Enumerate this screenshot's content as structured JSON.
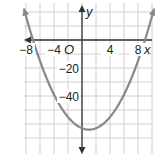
{
  "chart_data": {
    "type": "line",
    "title": "",
    "xlabel": "x",
    "ylabel": "y",
    "origin_label": "O",
    "xlim": [
      -11,
      10
    ],
    "ylim": [
      -72,
      20
    ],
    "x_grid_step": 2,
    "y_grid_step": 10,
    "grid": true,
    "x_ticks": [
      {
        "value": -8,
        "label": "−8"
      },
      {
        "value": -4,
        "label": "−4"
      },
      {
        "value": 4,
        "label": "4"
      },
      {
        "value": 8,
        "label": "8"
      }
    ],
    "y_ticks": [
      {
        "value": -20,
        "label": "−20"
      },
      {
        "value": -40,
        "label": "−40"
      }
    ],
    "series": [
      {
        "name": "parabola",
        "equation": "y = x^2 - 2x - 63",
        "coefficients": {
          "a": 1,
          "b": -2,
          "c": -63
        },
        "vertex": [
          1,
          -64
        ],
        "x_intercepts": [
          -7,
          9
        ],
        "x_range": [
          -8.3,
          10.3
        ],
        "color": "#888888",
        "arrows": true
      }
    ]
  }
}
